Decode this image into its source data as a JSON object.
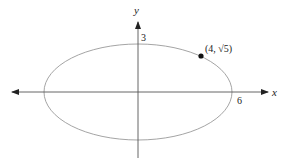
{
  "diagram": {
    "type": "ellipse-graph",
    "axes": {
      "x_label": "x",
      "y_label": "y"
    },
    "ellipse": {
      "semi_major_x": 6,
      "semi_minor_y": 3,
      "x_intercept_label": "6",
      "y_intercept_label": "3"
    },
    "point": {
      "label": "(4, √5)",
      "x": 4,
      "y": "√5"
    },
    "colors": {
      "ellipse": "#9a9a9a",
      "axes": "#555555",
      "point": "#111111",
      "text": "#222222"
    }
  }
}
